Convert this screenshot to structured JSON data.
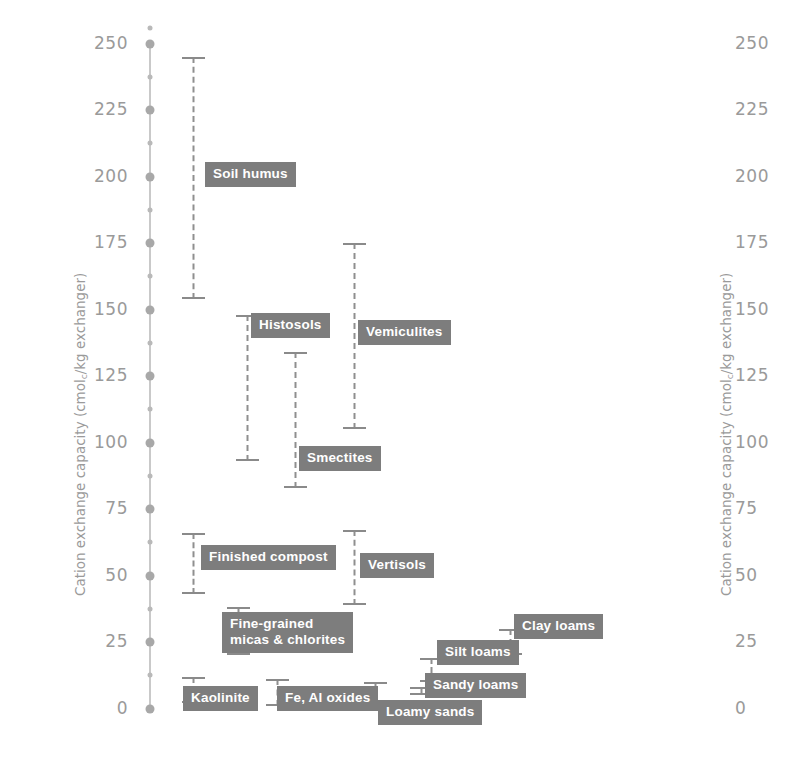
{
  "chart_data": {
    "type": "bar",
    "subtype": "range-bars-vertical",
    "title": "",
    "xlabel": "",
    "ylabel": "Cation exchange capacity (cmolc/kg exchanger)",
    "ylim": [
      0,
      256
    ],
    "yticks": [
      0,
      25,
      50,
      75,
      100,
      125,
      150,
      175,
      200,
      225,
      250
    ],
    "ytick_labels": [
      "0",
      "25",
      "50",
      "75",
      "100",
      "125",
      "150",
      "175",
      "200",
      "225",
      "250"
    ],
    "minor_ticks": [
      12.5,
      37.5,
      62.5,
      87.5,
      112.5,
      137.5,
      162.5,
      187.5,
      212.5,
      237.5
    ],
    "axis_top_marker": 256,
    "grid": false,
    "legend": false,
    "dual_axis": true,
    "categories": [
      {
        "label": "Soil humus",
        "low": 154,
        "high": 245,
        "x": 193,
        "label_x": 205,
        "label_y": 162,
        "lines": 1
      },
      {
        "label": "Histosols",
        "low": 93,
        "high": 148,
        "x": 247,
        "label_x": 251,
        "label_y": 313,
        "lines": 1
      },
      {
        "label": "Smectites",
        "low": 83,
        "high": 134,
        "x": 295,
        "label_x": 299,
        "label_y": 446,
        "lines": 1
      },
      {
        "label": "Vemiculites",
        "low": 105,
        "high": 175,
        "x": 354,
        "label_x": 358,
        "label_y": 320,
        "lines": 1
      },
      {
        "label": "Finished compost",
        "low": 43,
        "high": 66,
        "x": 193,
        "label_x": 201,
        "label_y": 545,
        "lines": 1
      },
      {
        "label": "Vertisols",
        "low": 39,
        "high": 67,
        "x": 354,
        "label_x": 360,
        "label_y": 553,
        "lines": 1
      },
      {
        "label": "Fine-grained\nmicas & chlorites",
        "low": 20,
        "high": 38,
        "x": 238,
        "label_x": 222,
        "label_y": 612,
        "lines": 2
      },
      {
        "label": "Kaolinite",
        "low": 2,
        "high": 12,
        "x": 193,
        "label_x": 183,
        "label_y": 686,
        "lines": 1
      },
      {
        "label": "Fe, Al oxides",
        "low": 1,
        "high": 11,
        "x": 277,
        "label_x": 277,
        "label_y": 686,
        "lines": 1
      },
      {
        "label": "Loamy sands",
        "low": 1,
        "high": 10,
        "x": 375,
        "label_x": 378,
        "label_y": 700,
        "lines": 1
      },
      {
        "label": "Sandy loams",
        "low": 5,
        "high": 8,
        "x": 421,
        "label_x": 425,
        "label_y": 673,
        "lines": 1
      },
      {
        "label": "Silt loams",
        "low": 10,
        "high": 19,
        "x": 431,
        "label_x": 437,
        "label_y": 640,
        "lines": 1
      },
      {
        "label": "Clay loams",
        "low": 20,
        "high": 30,
        "x": 510,
        "label_x": 514,
        "label_y": 614,
        "lines": 1
      }
    ]
  },
  "axis": {
    "left_title": "Cation exchange capacity (cmol",
    "left_title_sub": "c",
    "left_title_tail": "/kg exchanger)",
    "right_title": "Cation exchange capacity (cmol",
    "right_title_sub": "c",
    "right_title_tail": "/kg exchanger)"
  },
  "colors": {
    "tag_background": "#7d7d7d",
    "tag_text": "#ffffff",
    "tick_text": "#9a9a9a",
    "bar_line": "#8a8a8a",
    "spine": "#c9c9c9",
    "spine_dot": "#a8a8a8",
    "page_background": "#ffffff"
  }
}
